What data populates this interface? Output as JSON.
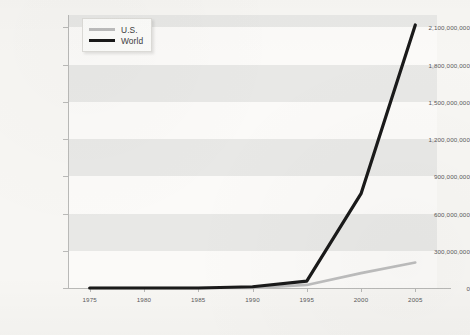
{
  "chart_data": {
    "type": "line",
    "title": "",
    "xlabel": "",
    "ylabel": "",
    "x": [
      1975,
      1980,
      1985,
      1990,
      1995,
      2000,
      2005
    ],
    "xlim": [
      1973,
      2007
    ],
    "ylim": [
      0,
      2200000000
    ],
    "grid": "horizontal-bands",
    "legend_position": "top-left",
    "y_ticks": [
      0,
      300000000,
      600000000,
      900000000,
      1200000000,
      1500000000,
      1800000000,
      2100000000
    ],
    "y_tick_labels": [
      "0",
      "300,000,000",
      "600,000,000",
      "900,000,000",
      "1,200,000,000",
      "1,500,000,000",
      "1,800,000,000",
      "2,100,000,000"
    ],
    "x_ticks": [
      1975,
      1980,
      1985,
      1990,
      1995,
      2000,
      2005
    ],
    "x_tick_labels": [
      "1975",
      "1980",
      "1985",
      "1990",
      "1995",
      "2000",
      "2005"
    ],
    "series": [
      {
        "name": "U.S.",
        "color": "#bdbdbd",
        "values": [
          0,
          0,
          0,
          0,
          25000000,
          120000000,
          205000000
        ]
      },
      {
        "name": "World",
        "color": "#1a1a1a",
        "values": [
          0,
          0,
          0,
          10000000,
          55000000,
          760000000,
          2120000000
        ]
      }
    ]
  },
  "legend": {
    "items": [
      {
        "label": "U.S.",
        "color": "#bdbdbd"
      },
      {
        "label": "World",
        "color": "#1a1a1a"
      }
    ]
  },
  "colors": {
    "page_background": "#f7f6f3",
    "plot_background": "#fbfaf8",
    "band": "#e8e8e6",
    "axis": "#b9b9b7",
    "tick_text": "#59585a",
    "us_line": "#bdbdbd",
    "world_line": "#1a1a1a"
  }
}
